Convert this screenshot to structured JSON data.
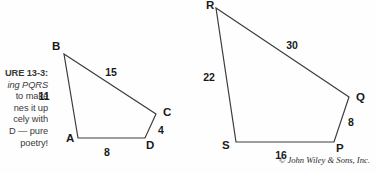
{
  "figure": {
    "caption_lines": [
      "URE 13-3:",
      "ing PQRS",
      "to make",
      "nes it up",
      "cely with",
      "D — pure",
      "poetry!"
    ],
    "caption_line_1": "URE 13-3:",
    "caption_line_2": "ing PQRS",
    "caption_line_3": "to make",
    "caption_line_4": "nes it up",
    "caption_line_5": "cely with",
    "caption_line_6": "D — pure",
    "caption_line_7": "poetry!",
    "copyright": "© John Wiley & Sons, Inc.",
    "stroke_color": "#3c3c3c",
    "text_color": "#1a1a1a",
    "background_color": "#fefefe"
  },
  "chart_data": {
    "type": "diagram",
    "shapes": [
      {
        "name": "quadrilateral-abcd",
        "vertices": [
          {
            "label": "A",
            "x": 78,
            "y": 138,
            "label_x": 66,
            "label_y": 142
          },
          {
            "label": "B",
            "x": 64,
            "y": 54,
            "label_x": 52,
            "label_y": 50
          },
          {
            "label": "C",
            "x": 156,
            "y": 114,
            "label_x": 163,
            "label_y": 116
          },
          {
            "label": "D",
            "x": 145,
            "y": 138,
            "label_x": 146,
            "label_y": 149
          }
        ],
        "sides": [
          {
            "from": "A",
            "to": "B",
            "length": "11",
            "label_x": 44,
            "label_y": 100
          },
          {
            "from": "B",
            "to": "C",
            "length": "15",
            "label_x": 111,
            "label_y": 76
          },
          {
            "from": "C",
            "to": "D",
            "length": "4",
            "label_x": 161,
            "label_y": 134
          },
          {
            "from": "D",
            "to": "A",
            "length": "8",
            "label_x": 107,
            "label_y": 156
          }
        ]
      },
      {
        "name": "quadrilateral-pqrs",
        "vertices": [
          {
            "label": "R",
            "x": 216,
            "y": 8,
            "label_x": 206,
            "label_y": 9
          },
          {
            "label": "Q",
            "x": 349,
            "y": 97,
            "label_x": 356,
            "label_y": 101
          },
          {
            "label": "P",
            "x": 334,
            "y": 142,
            "label_x": 336,
            "label_y": 152
          },
          {
            "label": "S",
            "x": 236,
            "y": 142,
            "label_x": 222,
            "label_y": 149
          }
        ],
        "sides": [
          {
            "from": "R",
            "to": "S",
            "length": "22",
            "label_x": 209,
            "label_y": 81
          },
          {
            "from": "R",
            "to": "Q",
            "length": "30",
            "label_x": 292,
            "label_y": 49
          },
          {
            "from": "Q",
            "to": "P",
            "length": "8",
            "label_x": 351,
            "label_y": 126
          },
          {
            "from": "S",
            "to": "P",
            "length": "16",
            "label_x": 281,
            "label_y": 159
          }
        ]
      }
    ]
  }
}
